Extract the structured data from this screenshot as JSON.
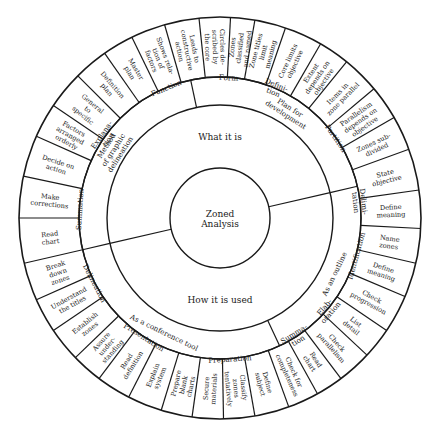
{
  "diagram": {
    "type": "radial-wheel",
    "center": {
      "x": 220,
      "y": 218
    },
    "radii": [
      50,
      113,
      141,
      201
    ],
    "colors": {
      "line": "#1a1a1a",
      "background": "#ffffff",
      "text": "#1a1a1a"
    },
    "core": {
      "lines": [
        "Zoned",
        "Analysis"
      ]
    },
    "ring1": [
      {
        "label": "What it is",
        "start": -103,
        "end": 77
      },
      {
        "label": "How it is used",
        "start": 77,
        "end": 257
      }
    ],
    "ring2": [
      {
        "lines": [
          "Method",
          "of graphic",
          "delineation"
        ],
        "start": -103,
        "end": -12
      },
      {
        "lines": [
          "Plan for",
          "development"
        ],
        "start": -12,
        "end": 77
      },
      {
        "lines": [
          "As an outline"
        ],
        "start": 77,
        "end": 155
      },
      {
        "lines": [
          "As a conference tool"
        ],
        "start": 155,
        "end": 257
      }
    ],
    "ring3": [
      {
        "lines": [
          "Summation"
        ],
        "start": -103,
        "end": -70
      },
      {
        "lines": [
          "Explana-",
          "tion"
        ],
        "start": -70,
        "end": -40
      },
      {
        "lines": [
          "Function"
        ],
        "start": -40,
        "end": -5
      },
      {
        "lines": [
          "Form"
        ],
        "start": -5,
        "end": 12
      },
      {
        "lines": [
          "Defini-",
          "tion"
        ],
        "start": 12,
        "end": 34
      },
      {
        "lines": [
          "Partition"
        ],
        "start": 34,
        "end": 77
      },
      {
        "lines": [
          "Delimi-",
          "tation"
        ],
        "start": 77,
        "end": 90
      },
      {
        "lines": [
          "Identification"
        ],
        "start": 90,
        "end": 121
      },
      {
        "lines": [
          "Elab-",
          "oration"
        ],
        "start": 121,
        "end": 140
      },
      {
        "lines": [
          "Summa-",
          "tion"
        ],
        "start": 140,
        "end": 155
      },
      {
        "lines": [
          "Preparation"
        ],
        "start": 155,
        "end": 197
      },
      {
        "lines": [
          "Presentation"
        ],
        "start": 197,
        "end": 228
      },
      {
        "lines": [
          "Delineation"
        ],
        "start": 228,
        "end": 257
      }
    ],
    "ring4": [
      {
        "lines": [
          "Read",
          "chart"
        ],
        "start": -103,
        "end": -90
      },
      {
        "lines": [
          "Make",
          "corrections"
        ],
        "start": -90,
        "end": -78
      },
      {
        "lines": [
          "Decide on",
          "action"
        ],
        "start": -78,
        "end": -66
      },
      {
        "lines": [
          "Factors",
          "arranged",
          "orderly"
        ],
        "start": -66,
        "end": -56
      },
      {
        "lines": [
          "General",
          "to",
          "specific"
        ],
        "start": -56,
        "end": -45
      },
      {
        "lines": [
          "Definition",
          "plan"
        ],
        "start": -45,
        "end": -35
      },
      {
        "lines": [
          "Master",
          "plan"
        ],
        "start": -35,
        "end": -26
      },
      {
        "lines": [
          "Shows rela-",
          "tion of",
          "factors"
        ],
        "start": -26,
        "end": -16
      },
      {
        "lines": [
          "Leads to",
          "constructive",
          "action"
        ],
        "start": -16,
        "end": -6
      },
      {
        "lines": [
          "Circles de-",
          "scribed by",
          "the core"
        ],
        "start": -6,
        "end": 3
      },
      {
        "lines": [
          "Zones",
          "classified",
          "and named"
        ],
        "start": 3,
        "end": 10
      },
      {
        "lines": [
          "Zone titles",
          "limit",
          "meaning"
        ],
        "start": 10,
        "end": 19
      },
      {
        "lines": [
          "Core limits",
          "objective"
        ],
        "start": 19,
        "end": 30
      },
      {
        "lines": [
          "Extent",
          "depends on",
          "objective"
        ],
        "start": 30,
        "end": 39
      },
      {
        "lines": [
          "Items in",
          "zone parallel"
        ],
        "start": 39,
        "end": 50
      },
      {
        "lines": [
          "Parallelism",
          "depends on",
          "objective"
        ],
        "start": 50,
        "end": 60
      },
      {
        "lines": [
          "Zones sub-",
          "divided"
        ],
        "start": 60,
        "end": 70
      },
      {
        "lines": [
          "State",
          "objective"
        ],
        "start": 70,
        "end": 82
      },
      {
        "lines": [
          "Define",
          "meaning"
        ],
        "start": 82,
        "end": 93
      },
      {
        "lines": [
          "Name",
          "zones"
        ],
        "start": 93,
        "end": 103
      },
      {
        "lines": [
          "Define",
          "meaning"
        ],
        "start": 103,
        "end": 113
      },
      {
        "lines": [
          "Check",
          "progression"
        ],
        "start": 113,
        "end": 124
      },
      {
        "lines": [
          "List",
          "detail"
        ],
        "start": 124,
        "end": 133
      },
      {
        "lines": [
          "Check",
          "parallelism"
        ],
        "start": 133,
        "end": 143
      },
      {
        "lines": [
          "Read",
          "chart"
        ],
        "start": 143,
        "end": 151
      },
      {
        "lines": [
          "Check for",
          "completeness"
        ],
        "start": 151,
        "end": 160
      },
      {
        "lines": [
          "Define",
          "subject"
        ],
        "start": 160,
        "end": 170
      },
      {
        "lines": [
          "Classify",
          "zones",
          "tentatively"
        ],
        "start": 170,
        "end": 179
      },
      {
        "lines": [
          "Secure",
          "materials"
        ],
        "start": 179,
        "end": 188
      },
      {
        "lines": [
          "Prepare",
          "blank",
          "charts"
        ],
        "start": 188,
        "end": 197
      },
      {
        "lines": [
          "Explain",
          "system"
        ],
        "start": 197,
        "end": 207
      },
      {
        "lines": [
          "Read",
          "definition"
        ],
        "start": 207,
        "end": 217
      },
      {
        "lines": [
          "Assure",
          "under-",
          "standing"
        ],
        "start": 217,
        "end": 226
      },
      {
        "lines": [
          "Establish",
          "zones"
        ],
        "start": 226,
        "end": 236
      },
      {
        "lines": [
          "Understand",
          "the titles"
        ],
        "start": 236,
        "end": 246
      },
      {
        "lines": [
          "Break",
          "down",
          "zones"
        ],
        "start": 246,
        "end": 257
      }
    ]
  }
}
